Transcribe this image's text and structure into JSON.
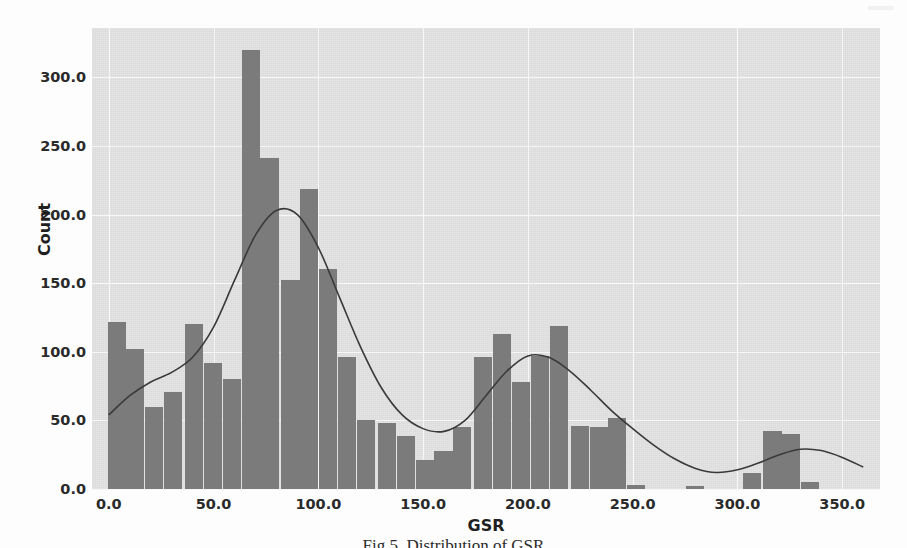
{
  "figure": {
    "caption": "Fig 5. Distribution of GSR",
    "background_color": "#fdfdfd",
    "plot_background_color": "#e3e3e3",
    "bar_color": "#7b7b7b",
    "kde_line_color": "#3a3a3a",
    "gridline_color": "#f7f7f7"
  },
  "chart_data": {
    "type": "bar",
    "title": "",
    "subtitle": "",
    "xlabel": "GSR",
    "ylabel": "Count",
    "xlim": [
      -8,
      368
    ],
    "ylim": [
      0,
      336
    ],
    "xticks": [
      "0.0",
      "50.0",
      "100.0",
      "150.0",
      "200.0",
      "250.0",
      "300.0",
      "350.0"
    ],
    "xtick_values": [
      0,
      50,
      100,
      150,
      200,
      250,
      300,
      350
    ],
    "yticks": [
      "0.0",
      "50.0",
      "100.0",
      "150.0",
      "200.0",
      "250.0",
      "300.0"
    ],
    "ytick_values": [
      0,
      50,
      100,
      150,
      200,
      250,
      300
    ],
    "grid": true,
    "legend": null,
    "bin_width": 9.2,
    "bin_centers": [
      4,
      13,
      22,
      31,
      41,
      50,
      59,
      68,
      77,
      87,
      96,
      105,
      114,
      123,
      133,
      142,
      151,
      160,
      169,
      179,
      188,
      197,
      206,
      215,
      225,
      234,
      243,
      252,
      261,
      271,
      280,
      289,
      298,
      307,
      317,
      326,
      335,
      344,
      353
    ],
    "values": [
      122,
      102,
      60,
      71,
      120,
      92,
      80,
      320,
      241,
      152,
      219,
      160,
      96,
      50,
      48,
      39,
      21,
      28,
      45,
      96,
      113,
      78,
      97,
      119,
      46,
      45,
      52,
      3,
      0,
      0,
      2,
      0,
      0,
      12,
      42,
      40,
      5,
      0,
      0
    ],
    "kde": {
      "description": "Kernel density estimate overlay scaled to counts",
      "x": [
        0,
        10,
        20,
        30,
        40,
        50,
        60,
        70,
        80,
        90,
        100,
        110,
        120,
        130,
        140,
        150,
        160,
        170,
        180,
        190,
        200,
        210,
        220,
        230,
        240,
        250,
        260,
        270,
        280,
        290,
        300,
        310,
        320,
        330,
        340,
        350,
        360
      ],
      "y": [
        54,
        68,
        78,
        85,
        96,
        118,
        152,
        185,
        203,
        200,
        176,
        140,
        104,
        74,
        54,
        44,
        42,
        50,
        68,
        86,
        97,
        96,
        86,
        72,
        57,
        44,
        32,
        22,
        15,
        12,
        14,
        19,
        25,
        29,
        28,
        23,
        16
      ]
    }
  }
}
